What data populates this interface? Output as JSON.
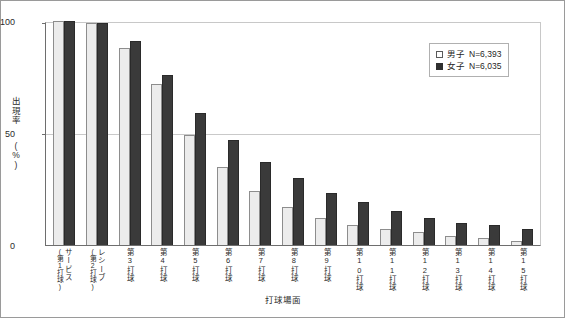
{
  "chart_data": {
    "type": "bar",
    "title": "",
    "xlabel": "打球場面",
    "ylabel": "出現率(%)",
    "ylabel_chars": [
      "出",
      "現",
      "率",
      "(",
      "%",
      ")"
    ],
    "ylim": [
      0,
      100
    ],
    "yticks": [
      0,
      50,
      100
    ],
    "ytick_labels": [
      "0",
      "50",
      "100"
    ],
    "grid": true,
    "grid_axis": "y",
    "legend_position": "top-right",
    "categories": [
      "サービス(第1打球)",
      "レシーブ(第2打球)",
      "第3打球",
      "第4打球",
      "第5打球",
      "第6打球",
      "第7打球",
      "第8打球",
      "第9打球",
      "第10打球",
      "第11打球",
      "第12打球",
      "第13打球",
      "第14打球",
      "第15打球"
    ],
    "category_parts": [
      {
        "main": "サービス",
        "sub": "(第1打球)"
      },
      {
        "main": "レシーブ",
        "sub": "(第2打球)"
      },
      {
        "main": "第3打球",
        "sub": ""
      },
      {
        "main": "第4打球",
        "sub": ""
      },
      {
        "main": "第5打球",
        "sub": ""
      },
      {
        "main": "第6打球",
        "sub": ""
      },
      {
        "main": "第7打球",
        "sub": ""
      },
      {
        "main": "第8打球",
        "sub": ""
      },
      {
        "main": "第9打球",
        "sub": ""
      },
      {
        "main": "第10打球",
        "sub": ""
      },
      {
        "main": "第11打球",
        "sub": ""
      },
      {
        "main": "第12打球",
        "sub": ""
      },
      {
        "main": "第13打球",
        "sub": ""
      },
      {
        "main": "第14打球",
        "sub": ""
      },
      {
        "main": "第15打球",
        "sub": ""
      }
    ],
    "series": [
      {
        "name": "男子",
        "legend_label": "男子  N=6,393",
        "n_label": "N=6,393",
        "n": 6393,
        "color": "#ececec",
        "edge_color": "#8d8d8d",
        "values": [
          100,
          99,
          88,
          72,
          49,
          35,
          24,
          17,
          12,
          9,
          7,
          6,
          4,
          3,
          2
        ]
      },
      {
        "name": "女子",
        "legend_label": "女子  N=6,035",
        "n_label": "N=6,035",
        "n": 6035,
        "color": "#3a3a3a",
        "edge_color": "#2a2a2a",
        "values": [
          100,
          99,
          91,
          76,
          59,
          47,
          37,
          30,
          23,
          19,
          15,
          12,
          10,
          9,
          7
        ]
      }
    ]
  },
  "legend": {
    "male": {
      "label": "男子",
      "n_label": "N=6,393",
      "swatch": "open-square-icon"
    },
    "female": {
      "label": "女子",
      "n_label": "N=6,035",
      "swatch": "filled-square-icon"
    }
  }
}
